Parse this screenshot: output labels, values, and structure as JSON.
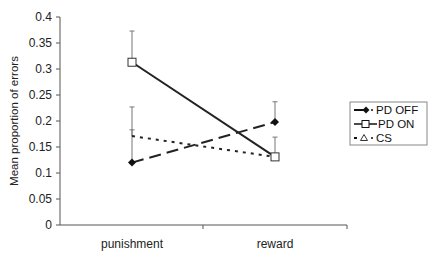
{
  "chart_data": {
    "type": "line",
    "title": "",
    "xlabel": "",
    "ylabel": "Mean proportion of errors",
    "categories": [
      "punishment",
      "reward"
    ],
    "ylim": [
      0,
      0.4
    ],
    "yticks": [
      "0",
      "0.05",
      "0.1",
      "0.15",
      "0.2",
      "0.25",
      "0.3",
      "0.35",
      "0.4"
    ],
    "grid": false,
    "legend_position": "right",
    "series": [
      {
        "name": "PD OFF",
        "values": [
          0.12,
          0.198
        ],
        "error_upper": [
          0.227,
          0.237
        ],
        "line_style": "dashed",
        "marker": "diamond-filled"
      },
      {
        "name": "PD ON",
        "values": [
          0.313,
          0.131
        ],
        "error_upper": [
          0.373,
          0.169
        ],
        "line_style": "solid",
        "marker": "square-open"
      },
      {
        "name": "CS",
        "values": [
          0.171,
          0.131
        ],
        "error_upper": [
          0.183,
          0.131
        ],
        "line_style": "dotted",
        "marker": "triangle-open"
      }
    ]
  },
  "legend": {
    "items": [
      {
        "label": "PD OFF"
      },
      {
        "label": "PD ON"
      },
      {
        "label": "CS"
      }
    ]
  },
  "axis": {
    "ylabel": "Mean proportion of errors",
    "xlabels": [
      "punishment",
      "reward"
    ],
    "yticks": [
      "0",
      "0.05",
      "0.1",
      "0.15",
      "0.2",
      "0.25",
      "0.3",
      "0.35",
      "0.4"
    ]
  }
}
